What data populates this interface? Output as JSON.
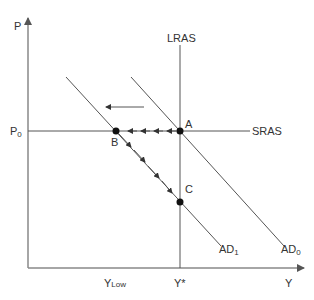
{
  "diagram": {
    "axes": {
      "y_label": "P",
      "x_label": "Y",
      "price_level_label": "P",
      "price_level_sub": "0",
      "output_low_label": "Y",
      "output_low_sub": "Low",
      "potential_output_label": "Y*"
    },
    "curves": {
      "lras": "LRAS",
      "sras": "SRAS",
      "ad0": "AD",
      "ad0_sub": "0",
      "ad1": "AD",
      "ad1_sub": "1"
    },
    "points": {
      "a": "A",
      "b": "B",
      "c": "C"
    },
    "colors": {
      "line": "#555555",
      "axis": "#888888",
      "point": "#111111",
      "text": "#333333"
    }
  }
}
